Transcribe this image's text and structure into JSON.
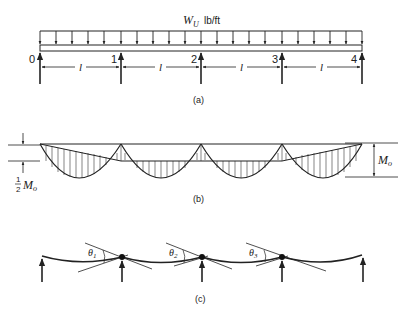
{
  "figure": {
    "part_a": {
      "load_label": "W",
      "load_subscript": "U",
      "load_units": "lb/ft",
      "support_labels": [
        "0",
        "1",
        "2",
        "3",
        "4"
      ],
      "span_labels": [
        "l",
        "l",
        "l",
        "l"
      ],
      "caption": "(a)"
    },
    "part_b": {
      "left_label_fraction_num": "1",
      "left_label_fraction_den": "2",
      "left_label": "M",
      "left_label_subscript": "o",
      "right_label": "M",
      "right_label_subscript": "o",
      "caption": "(b)"
    },
    "part_c": {
      "rotation_labels": [
        {
          "symbol": "θ",
          "subscript": "1"
        },
        {
          "symbol": "θ",
          "subscript": "2"
        },
        {
          "symbol": "θ",
          "subscript": "3"
        }
      ],
      "caption": "(c)"
    }
  }
}
